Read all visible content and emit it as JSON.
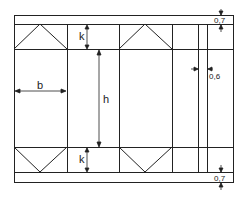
{
  "diagram": {
    "labels": {
      "b": "b",
      "h": "h",
      "k_top": "k",
      "k_bottom": "k",
      "strip_top": "0,7",
      "strip_bottom": "0,7",
      "gap": "0,6"
    },
    "colors": {
      "line": "#222222",
      "background": "#ffffff"
    }
  }
}
